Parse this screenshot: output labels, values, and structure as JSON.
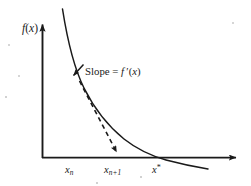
{
  "figure": {
    "kind": "diagram",
    "background_color": "#ffffff",
    "ink_color": "#1a1a1a",
    "axes": {
      "y_axis_label": "f(x)",
      "y_axis_label_parts": {
        "func": "f",
        "open": "(",
        "var": "x",
        "close": ")"
      },
      "x_axis_label": "",
      "origin_px": [
        42,
        158
      ],
      "y_axis_top_px": [
        42,
        22
      ],
      "x_axis_right_px": [
        240,
        158
      ],
      "arrowheads": [
        "y-axis-top",
        "x-axis-right"
      ]
    },
    "annotations": {
      "slope": {
        "text": "Slope = f '(x)",
        "parts": {
          "word": "Slope",
          "equals": "=",
          "func": "f",
          "prime": "′",
          "open": "(",
          "var": "x",
          "close": ")"
        },
        "pointer": "leader-arrow-to-curve"
      }
    },
    "x_tick_labels": [
      {
        "name": "x-sub-n",
        "base": "x",
        "sub": "n",
        "sup": "",
        "x_px": 72
      },
      {
        "name": "x-sub-n-plus-1",
        "base": "x",
        "sub": "n+1",
        "sup": "",
        "x_px": 115
      },
      {
        "name": "x-star",
        "base": "x",
        "sub": "",
        "sup": "*",
        "x_px": 157
      }
    ],
    "curve": {
      "style": "solid",
      "shape": "convex-decreasing",
      "crosses_x_axis_at": "x*",
      "continues_below_axis": true
    },
    "tangent": {
      "style": "dashed",
      "from": "point on curve at x_n",
      "to": "x-axis at x_(n+1)",
      "arrowhead": "end"
    }
  }
}
